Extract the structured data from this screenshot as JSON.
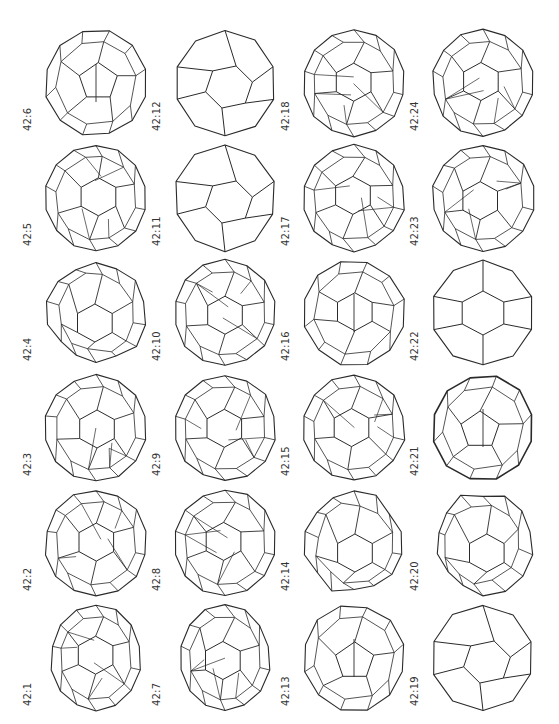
{
  "figure": {
    "columns": [
      {
        "items": [
          {
            "label": "42:1",
            "style": "oblong-hex"
          },
          {
            "label": "42:2",
            "style": "dense"
          },
          {
            "label": "42:3",
            "style": "dense"
          },
          {
            "label": "42:4",
            "style": "skew"
          },
          {
            "label": "42:5",
            "style": "dense"
          },
          {
            "label": "42:6",
            "style": "symmetric-pent"
          }
        ]
      },
      {
        "items": [
          {
            "label": "42:7",
            "style": "oblong-hex"
          },
          {
            "label": "42:8",
            "style": "hex"
          },
          {
            "label": "42:9",
            "style": "dense"
          },
          {
            "label": "42:10",
            "style": "dense"
          },
          {
            "label": "42:11",
            "style": "sparse"
          },
          {
            "label": "42:12",
            "style": "sparse"
          }
        ]
      },
      {
        "items": [
          {
            "label": "42:13",
            "style": "symmetric-pent"
          },
          {
            "label": "42:14",
            "style": "skew"
          },
          {
            "label": "42:15",
            "style": "dense"
          },
          {
            "label": "42:16",
            "style": "symmetric-hex"
          },
          {
            "label": "42:17",
            "style": "dense"
          },
          {
            "label": "42:18",
            "style": "dense"
          }
        ]
      },
      {
        "items": [
          {
            "label": "42:19",
            "style": "sparse"
          },
          {
            "label": "42:20",
            "style": "skew"
          },
          {
            "label": "42:21",
            "style": "symmetric-pent"
          },
          {
            "label": "42:22",
            "style": "sparse-sym"
          },
          {
            "label": "42:23",
            "style": "dense"
          },
          {
            "label": "42:24",
            "style": "dense"
          }
        ]
      }
    ]
  }
}
